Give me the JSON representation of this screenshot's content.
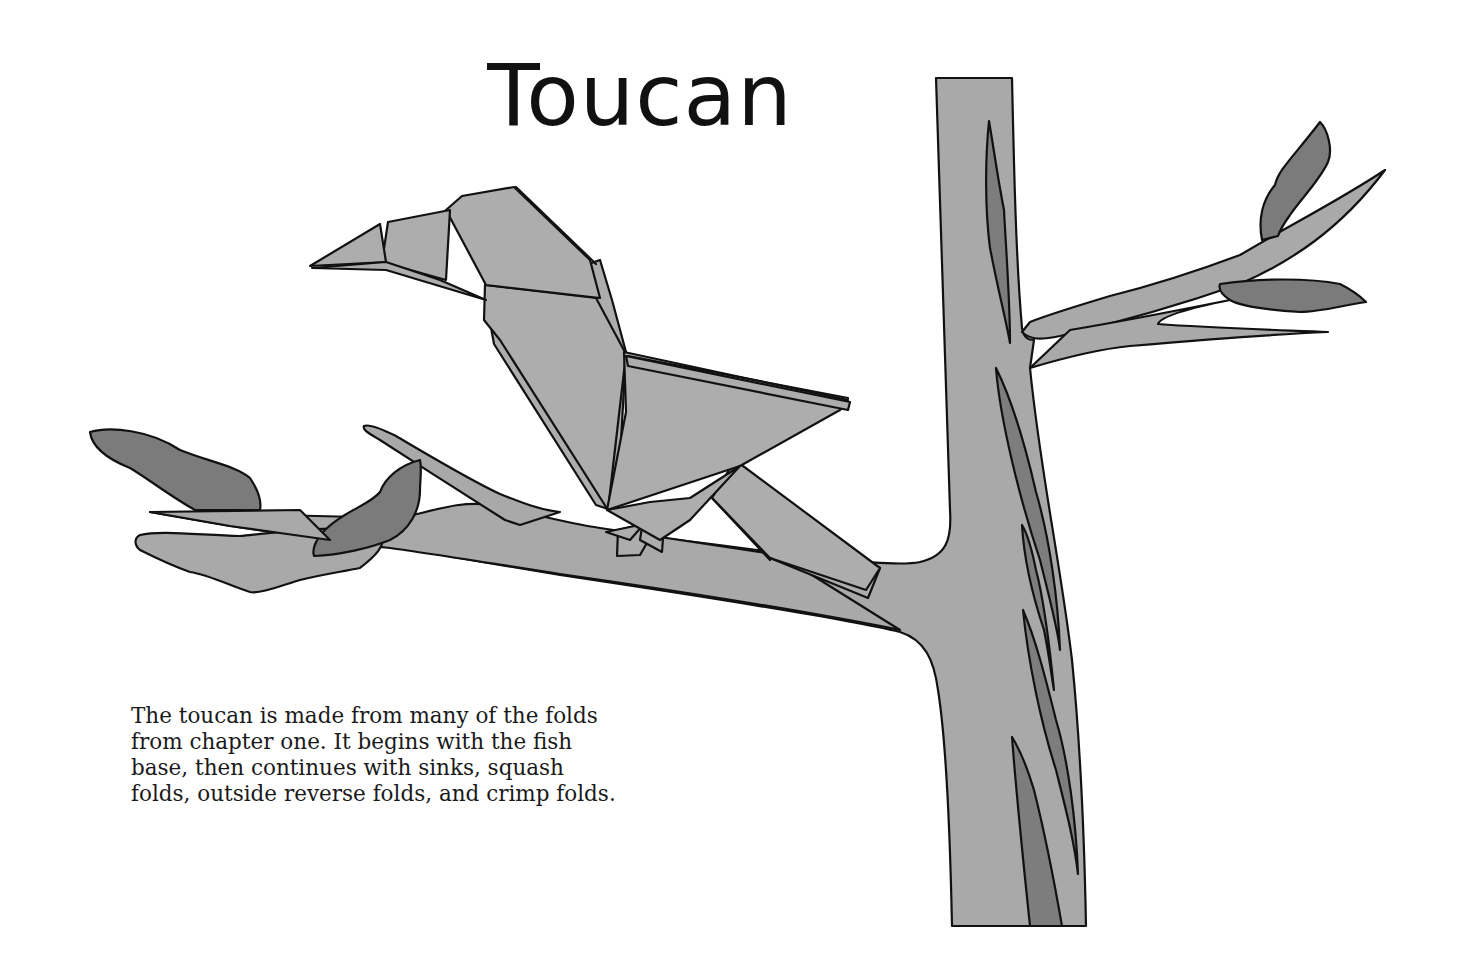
{
  "page": {
    "title": "Toucan",
    "caption_lines": [
      "The toucan is made from many of the folds",
      "from chapter one. It begins with the fish",
      "base, then continues with sinks, squash",
      "folds, outside reverse folds, and crimp folds."
    ]
  },
  "illustration": {
    "subject": "origami toucan perched on a tree branch",
    "elements": [
      "toucan",
      "tree-trunk",
      "branch",
      "leaves",
      "twig"
    ],
    "colors": {
      "paper_fill": "#adadad",
      "bark_fill": "#a9a9a9",
      "leaf_fill": "#7b7b7b",
      "outline": "#111111",
      "background": "#ffffff"
    }
  }
}
